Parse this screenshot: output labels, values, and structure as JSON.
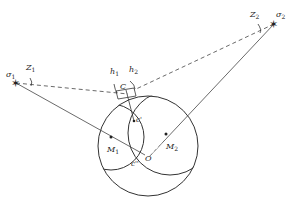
{
  "diagram": {
    "stars": [
      {
        "id": "sigma1",
        "label": "σ",
        "sub": "1",
        "x": 16,
        "y": 83
      },
      {
        "id": "sigma2",
        "label": "σ",
        "sub": "2",
        "x": 274,
        "y": 24
      }
    ],
    "zenith_labels": [
      {
        "label": "Z",
        "sub": "1",
        "x": 27,
        "y": 72
      },
      {
        "label": "Z",
        "sub": "2",
        "x": 253,
        "y": 18
      }
    ],
    "altitude_labels": [
      {
        "label": "h",
        "sub": "1",
        "x": 112,
        "y": 77
      },
      {
        "label": "h",
        "sub": "2",
        "x": 130,
        "y": 75
      }
    ],
    "points": [
      {
        "label": "C",
        "x": 120,
        "y": 89
      },
      {
        "label": "c'",
        "x": 134,
        "y": 121
      },
      {
        "label": "c''",
        "x": 130,
        "y": 164
      },
      {
        "label": "O",
        "x": 145,
        "y": 160
      },
      {
        "label": "M",
        "sub": "1",
        "x": 108,
        "y": 153
      },
      {
        "label": "M",
        "sub": "2",
        "x": 166,
        "y": 149
      }
    ],
    "colors": {
      "line": "#333333",
      "background": "#ffffff"
    }
  }
}
